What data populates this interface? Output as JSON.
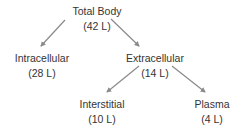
{
  "diagram": {
    "type": "tree-flow-diagram",
    "text_color": "#343434",
    "arrow_color": "#8a8a8a",
    "background": "#ffffff",
    "nodes": [
      {
        "id": "total-body",
        "label": "Total Body",
        "value": "(42 L)",
        "x": 97,
        "y": 4
      },
      {
        "id": "intracellular",
        "label": "Intracellular",
        "value": "(28 L)",
        "x": 42,
        "y": 51
      },
      {
        "id": "extracellular",
        "label": "Extracellular",
        "value": "(14 L)",
        "x": 155,
        "y": 51
      },
      {
        "id": "interstitial",
        "label": "Interstitial",
        "value": "(10 L)",
        "x": 102,
        "y": 97
      },
      {
        "id": "plasma",
        "label": "Plasma",
        "value": "(4 L)",
        "x": 212,
        "y": 97
      }
    ],
    "edges": [
      {
        "id": "total-body-to-intracellular",
        "from": "total-body",
        "to": "intracellular",
        "x1": 65,
        "y1": 20,
        "x2": 41,
        "y2": 46
      },
      {
        "id": "total-body-to-extracellular",
        "from": "total-body",
        "to": "extracellular",
        "x1": 111,
        "y1": 19,
        "x2": 139,
        "y2": 46
      },
      {
        "id": "extracellular-to-interstitial",
        "from": "extracellular",
        "to": "interstitial",
        "x1": 139,
        "y1": 66,
        "x2": 107,
        "y2": 92
      },
      {
        "id": "extracellular-to-plasma",
        "from": "extracellular",
        "to": "plasma",
        "x1": 172,
        "y1": 66,
        "x2": 205,
        "y2": 92
      }
    ]
  }
}
